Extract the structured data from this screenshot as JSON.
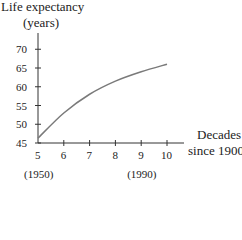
{
  "chart_data": {
    "type": "line",
    "title": "",
    "ylabel": "Life expectancy (years)",
    "ylabel_lines": [
      "Life expectancy",
      "(years)"
    ],
    "xlabel": "Decades since 1900",
    "xlabel_lines": [
      "Decades",
      "since 1900"
    ],
    "x": [
      5,
      6,
      7,
      8,
      9,
      10
    ],
    "series": [
      {
        "name": "Life expectancy",
        "values": [
          46.3,
          53,
          58,
          61.5,
          64,
          66
        ]
      }
    ],
    "xticks": [
      "5",
      "6",
      "7",
      "8",
      "9",
      "10"
    ],
    "yticks": [
      "45",
      "50",
      "55",
      "60",
      "65",
      "70"
    ],
    "xlim": [
      5,
      10.6
    ],
    "ylim": [
      45,
      74
    ],
    "annotations": [
      {
        "text": "(1950)",
        "at_x": 5
      },
      {
        "text": "(1990)",
        "at_x": 9
      }
    ],
    "grid": false,
    "legend": "none",
    "line_color": "#7a7a7a"
  }
}
